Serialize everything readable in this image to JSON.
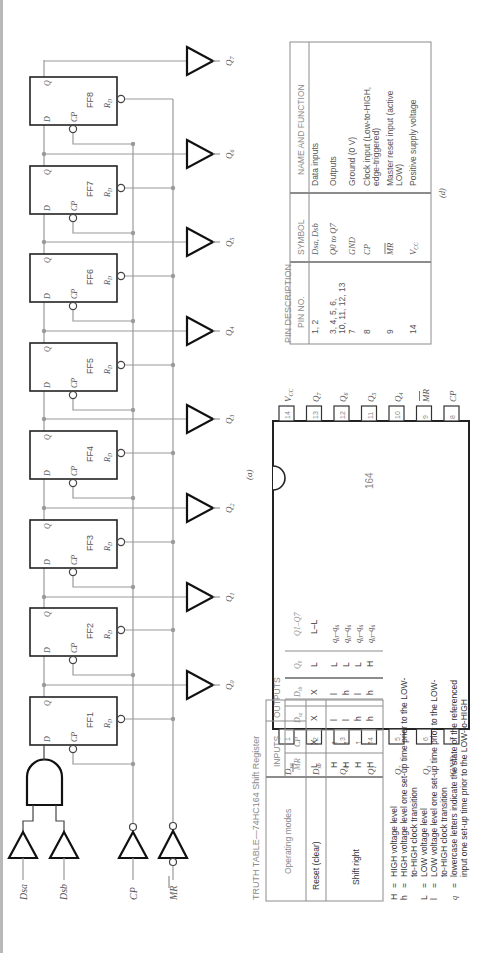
{
  "logic_diagram": {
    "flip_flops": [
      {
        "label": "FF1",
        "d": "D",
        "q": "Q",
        "cp": "CP",
        "rd": "R",
        "rd_sub": "D"
      },
      {
        "label": "FF2",
        "d": "D",
        "q": "Q",
        "cp": "CP",
        "rd": "R",
        "rd_sub": "D"
      },
      {
        "label": "FF3",
        "d": "D",
        "q": "Q",
        "cp": "CP",
        "rd": "R",
        "rd_sub": "D"
      },
      {
        "label": "FF4",
        "d": "D",
        "q": "Q",
        "cp": "CP",
        "rd": "R",
        "rd_sub": "D"
      },
      {
        "label": "FF5",
        "d": "D",
        "q": "Q",
        "cp": "CP",
        "rd": "R",
        "rd_sub": "D"
      },
      {
        "label": "FF6",
        "d": "D",
        "q": "Q",
        "cp": "CP",
        "rd": "R",
        "rd_sub": "D"
      },
      {
        "label": "FF7",
        "d": "D",
        "q": "Q",
        "cp": "CP",
        "rd": "R",
        "rd_sub": "D"
      },
      {
        "label": "FF8",
        "d": "D",
        "q": "Q",
        "cp": "CP",
        "rd": "R",
        "rd_sub": "D"
      }
    ],
    "outputs": [
      "Q0",
      "Q1",
      "Q2",
      "Q3",
      "Q4",
      "Q5",
      "Q6",
      "Q7"
    ],
    "inputs": {
      "dsa": "Dsa",
      "dsb": "Dsb",
      "cp": "CP",
      "mr": "MR"
    }
  },
  "pin_diagram": {
    "caption": "(a)",
    "chip_label": "164",
    "left_pins": [
      {
        "num": "1",
        "name": "Dsa"
      },
      {
        "num": "2",
        "name": "Dsb"
      },
      {
        "num": "3",
        "name": "Q0"
      },
      {
        "num": "4",
        "name": "Q1"
      },
      {
        "num": "5",
        "name": "Q2"
      },
      {
        "num": "6",
        "name": "Q3"
      },
      {
        "num": "7",
        "name": "GND"
      }
    ],
    "right_pins": [
      {
        "num": "14",
        "name": "VCC"
      },
      {
        "num": "13",
        "name": "Q7"
      },
      {
        "num": "12",
        "name": "Q6"
      },
      {
        "num": "11",
        "name": "Q5"
      },
      {
        "num": "10",
        "name": "Q4"
      },
      {
        "num": "9",
        "name": "MR"
      },
      {
        "num": "8",
        "name": "CP"
      }
    ]
  },
  "pin_description": {
    "title": "PIN DESCRIPTION",
    "caption": "(d)",
    "headers": [
      "PIN NO.",
      "SYMBOL",
      "NAME AND FUNCTION"
    ],
    "rows": [
      {
        "pin": "1, 2",
        "symbol": "Dsa, Dsb",
        "function": "Data inputs"
      },
      {
        "pin": "3, 4, 5, 6, 10, 11, 12, 13",
        "pin_line1": "3, 4, 5, 6,",
        "pin_line2": "10, 11, 12, 13",
        "symbol": "Q0 to Q7",
        "function": "Outputs"
      },
      {
        "pin": "7",
        "symbol": "GND",
        "function": "Ground (0 V)"
      },
      {
        "pin": "8",
        "symbol": "CP",
        "function": "Clock input (Low-to-HIGH, edge-triggered)",
        "function_line1": "Clock input (Low-to-HIGH,",
        "function_line2": "edge-triggered)"
      },
      {
        "pin": "9",
        "symbol": "MR",
        "function": "Master reset input (active LOW)",
        "function_line1": "Master reset input (active",
        "function_line2": "LOW)"
      },
      {
        "pin": "14",
        "symbol": "VCC",
        "function": "Positive supply voltage"
      }
    ]
  },
  "truth_table": {
    "title": "TRUTH TABLE—74HC164 Shift Register",
    "group_headers": {
      "mode": "Operating modes",
      "inputs": "INPUTS",
      "outputs": "OUTPUTS"
    },
    "col_headers": [
      "MR",
      "CP",
      "Dsa",
      "Dsb",
      "Q0",
      "Q1–Q7"
    ],
    "rows": [
      {
        "mode": "Reset (clear)",
        "mr": "L",
        "cp": "X",
        "dsa": "X",
        "dsb": "X",
        "q0": "L",
        "q17": "L–L"
      },
      {
        "mode": "Shift right",
        "mr": "H",
        "cp": "↑",
        "dsa": "l",
        "dsb": "l",
        "q0": "L",
        "q17": "q0–q6"
      },
      {
        "mode": "",
        "mr": "H",
        "cp": "↑",
        "dsa": "l",
        "dsb": "h",
        "q0": "L",
        "q17": "q0–q6"
      },
      {
        "mode": "",
        "mr": "H",
        "cp": "↑",
        "dsa": "h",
        "dsb": "l",
        "q0": "L",
        "q17": "q0–q6"
      },
      {
        "mode": "",
        "mr": "H",
        "cp": "↑",
        "dsa": "h",
        "dsb": "h",
        "q0": "H",
        "q17": "q0–q6"
      }
    ]
  },
  "legend": [
    {
      "sym": "H",
      "eq": "=",
      "lines": [
        "HIGH voltage level"
      ]
    },
    {
      "sym": "h",
      "eq": "=",
      "lines": [
        "HIGH voltage level one set-up time prior to the LOW-",
        "to-HIGH clock transition"
      ]
    },
    {
      "sym": "L",
      "eq": "=",
      "lines": [
        "LOW voltage level"
      ]
    },
    {
      "sym": "l",
      "eq": "=",
      "lines": [
        "LOW voltage level one set-up time prior to the LOW-",
        "to-HIGH clock transition"
      ]
    },
    {
      "sym": "q",
      "eq": "=",
      "lines": [
        "lowercase letters indicate the state of the referenced",
        "input one set-up time prior to the LOW-to-HIGH"
      ]
    }
  ]
}
